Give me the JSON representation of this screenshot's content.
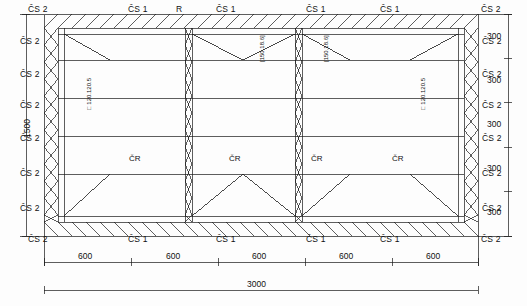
{
  "drawing": {
    "title": "steel truss roof framing plan",
    "line_color": "#1a1a1a",
    "background": "#fdfdfd",
    "labels": {
      "cs2": "ČS 2",
      "cs1": "ČS 1",
      "r": "R",
      "cr": "ČR",
      "profile": "□ 120.120.5",
      "member_small": "[150.18.6]"
    },
    "top_labels": [
      {
        "text": "ČS 2",
        "x": 30,
        "y": 7
      },
      {
        "text": "ČS 1",
        "x": 130,
        "y": 7
      },
      {
        "text": "R",
        "x": 175,
        "y": 7
      },
      {
        "text": "ČS 1",
        "x": 218,
        "y": 7
      },
      {
        "text": "ČS 1",
        "x": 308,
        "y": 7
      },
      {
        "text": "ČS 1",
        "x": 382,
        "y": 7
      },
      {
        "text": "ČS 2",
        "x": 482,
        "y": 7
      }
    ],
    "bottom_labels": [
      {
        "text": "ČS 2",
        "x": 30,
        "y": 237
      },
      {
        "text": "ČS 1",
        "x": 130,
        "y": 237
      },
      {
        "text": "ČS 1",
        "x": 218,
        "y": 237
      },
      {
        "text": "ČS 1",
        "x": 308,
        "y": 237
      },
      {
        "text": "ČS 1",
        "x": 382,
        "y": 237
      },
      {
        "text": "ČS 2",
        "x": 482,
        "y": 237
      }
    ],
    "left_labels": [
      {
        "text": "ČS 2",
        "x": 22,
        "y": 40
      },
      {
        "text": "ČS 2",
        "x": 22,
        "y": 74
      },
      {
        "text": "ČS 2",
        "x": 22,
        "y": 104
      },
      {
        "text": "ČS 2",
        "x": 22,
        "y": 137
      },
      {
        "text": "ČS 2",
        "x": 22,
        "y": 172
      },
      {
        "text": "ČS 2",
        "x": 22,
        "y": 207
      }
    ],
    "right_labels": [
      {
        "text": "ČS 2",
        "x": 484,
        "y": 40
      },
      {
        "text": "ČS 2",
        "x": 484,
        "y": 74
      },
      {
        "text": "ČS 2",
        "x": 484,
        "y": 104
      },
      {
        "text": "ČS 2",
        "x": 484,
        "y": 137
      },
      {
        "text": "ČS 2",
        "x": 484,
        "y": 172
      },
      {
        "text": "ČS 2",
        "x": 484,
        "y": 207
      }
    ],
    "cr_labels": [
      {
        "text": "ČR",
        "x": 131,
        "y": 158
      },
      {
        "text": "ČR",
        "x": 231,
        "y": 158
      },
      {
        "text": "ČR",
        "x": 313,
        "y": 158
      },
      {
        "text": "ČR",
        "x": 394,
        "y": 158
      }
    ],
    "profile_labels": [
      {
        "text": "□ 120.120.5",
        "x": 83,
        "y": 86
      },
      {
        "text": "□ 120.120.5",
        "x": 417,
        "y": 86
      }
    ],
    "inner_member_labels": [
      {
        "text": "[150.18.6]",
        "x": 256,
        "y": 48
      },
      {
        "text": "[150.18.6]",
        "x": 320,
        "y": 48
      }
    ],
    "dimensions": {
      "left_vertical_total": "1500",
      "right_vertical_segments": [
        "300",
        "300",
        "300",
        "300",
        "300"
      ],
      "bottom_segments": [
        "600",
        "600",
        "600",
        "600",
        "600"
      ],
      "bottom_total": "3000"
    }
  }
}
